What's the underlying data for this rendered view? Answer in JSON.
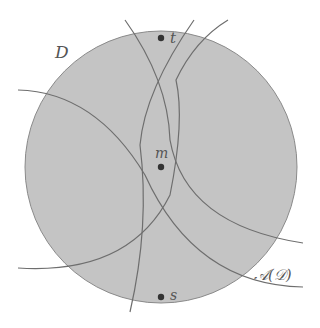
{
  "figure": {
    "disk": {
      "label": "D",
      "cx": 161,
      "cy": 167,
      "r": 136,
      "fill": "#c4c4c4",
      "stroke": "#8a8a8a"
    },
    "curve_color": "#6e6e6e",
    "points": [
      {
        "id": "t",
        "label": "t",
        "x": 161,
        "y": 38
      },
      {
        "id": "m",
        "label": "m",
        "x": 161,
        "y": 167
      },
      {
        "id": "s",
        "label": "s",
        "x": 161,
        "y": 297
      }
    ],
    "arrangement_label": "𝒜(𝒟)",
    "arcs": [
      {
        "id": "arc-1",
        "path": "M125,20 Q168,80 170,140 Q185,225 303,243"
      },
      {
        "id": "arc-2",
        "path": "M194,20 Q145,90 140,145 Q150,225 130,312"
      },
      {
        "id": "arc-3",
        "path": "M18,90 Q95,92 145,175 Q195,285 303,287"
      },
      {
        "id": "arc-4",
        "path": "M18,268 Q130,275 170,195 Q185,120 176,80 Q195,40 228,20"
      }
    ]
  }
}
